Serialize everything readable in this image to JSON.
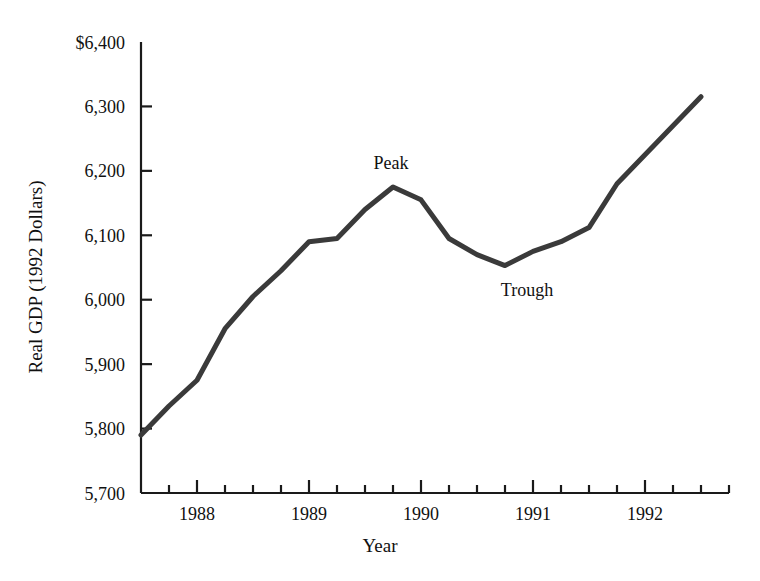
{
  "chart_data": {
    "type": "line",
    "title": "",
    "xlabel": "Year",
    "ylabel": "Real GDP (1992 Dollars)",
    "ylim": [
      5700,
      6400
    ],
    "ytick_labels": [
      "$6,400",
      "6,300",
      "6,200",
      "6,100",
      "6,000",
      "5,900",
      "5,800",
      "5,700"
    ],
    "ytick_values": [
      6400,
      6300,
      6200,
      6100,
      6000,
      5900,
      5800,
      5700
    ],
    "xtick_labels": [
      "1988",
      "1989",
      "1990",
      "1991",
      "1992"
    ],
    "xtick_values": [
      1988,
      1989,
      1990,
      1991,
      1992
    ],
    "xlim": [
      1987.5,
      1992.75
    ],
    "grid": false,
    "legend": null,
    "line_color": "#3a3a3a",
    "line_width": 5,
    "x": [
      1987.5,
      1987.75,
      1988.0,
      1988.25,
      1988.5,
      1988.75,
      1989.0,
      1989.25,
      1989.5,
      1989.75,
      1990.0,
      1990.25,
      1990.5,
      1990.75,
      1991.0,
      1991.25,
      1991.5,
      1991.75,
      1992.0,
      1992.25,
      1992.5
    ],
    "values": [
      5790,
      5835,
      5875,
      5955,
      6005,
      6045,
      6090,
      6095,
      6140,
      6175,
      6155,
      6095,
      6070,
      6053,
      6075,
      6090,
      6112,
      6180,
      6225,
      6270,
      6315
    ],
    "annotations": [
      {
        "label": "Peak",
        "x": 1989.75,
        "y": 6175,
        "position": "above"
      },
      {
        "label": "Trough",
        "x": 1990.75,
        "y": 6053,
        "position": "below"
      }
    ]
  },
  "axis": {
    "ylabel": "Real GDP (1992 Dollars)",
    "xlabel": "Year"
  },
  "annotations": {
    "peak": "Peak",
    "trough": "Trough"
  }
}
